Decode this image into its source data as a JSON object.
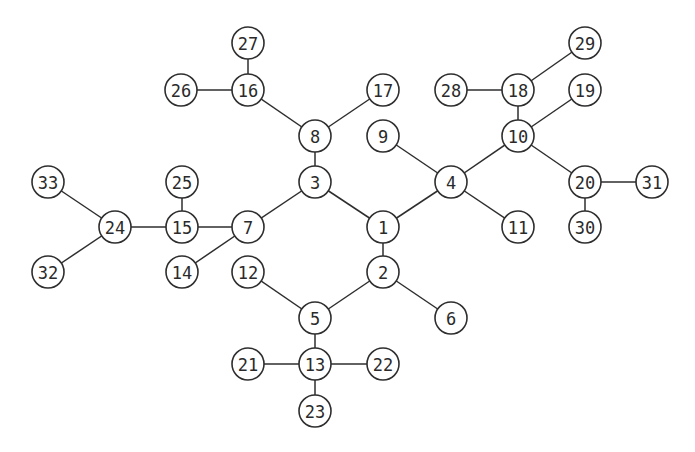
{
  "diagram": {
    "type": "tree",
    "node_radius": 16,
    "stroke_color": "#2e2e2e",
    "nodes": [
      {
        "id": "1",
        "label": "1",
        "x": 383,
        "y": 227
      },
      {
        "id": "2",
        "label": "2",
        "x": 383,
        "y": 272
      },
      {
        "id": "3",
        "label": "3",
        "x": 315,
        "y": 182
      },
      {
        "id": "4",
        "label": "4",
        "x": 451,
        "y": 182
      },
      {
        "id": "5",
        "label": "5",
        "x": 315,
        "y": 318
      },
      {
        "id": "6",
        "label": "6",
        "x": 451,
        "y": 318
      },
      {
        "id": "7",
        "label": "7",
        "x": 248,
        "y": 227
      },
      {
        "id": "8",
        "label": "8",
        "x": 315,
        "y": 136
      },
      {
        "id": "9",
        "label": "9",
        "x": 383,
        "y": 136
      },
      {
        "id": "10",
        "label": "10",
        "x": 518,
        "y": 136
      },
      {
        "id": "11",
        "label": "11",
        "x": 518,
        "y": 227
      },
      {
        "id": "12",
        "label": "12",
        "x": 248,
        "y": 272
      },
      {
        "id": "13",
        "label": "13",
        "x": 315,
        "y": 364
      },
      {
        "id": "14",
        "label": "14",
        "x": 182,
        "y": 272
      },
      {
        "id": "15",
        "label": "15",
        "x": 182,
        "y": 227
      },
      {
        "id": "16",
        "label": "16",
        "x": 248,
        "y": 90
      },
      {
        "id": "17",
        "label": "17",
        "x": 383,
        "y": 90
      },
      {
        "id": "18",
        "label": "18",
        "x": 518,
        "y": 90
      },
      {
        "id": "19",
        "label": "19",
        "x": 585,
        "y": 90
      },
      {
        "id": "20",
        "label": "20",
        "x": 585,
        "y": 182
      },
      {
        "id": "21",
        "label": "21",
        "x": 248,
        "y": 364
      },
      {
        "id": "22",
        "label": "22",
        "x": 383,
        "y": 364
      },
      {
        "id": "23",
        "label": "23",
        "x": 315,
        "y": 411
      },
      {
        "id": "24",
        "label": "24",
        "x": 115,
        "y": 227
      },
      {
        "id": "25",
        "label": "25",
        "x": 182,
        "y": 182
      },
      {
        "id": "26",
        "label": "26",
        "x": 181,
        "y": 90
      },
      {
        "id": "27",
        "label": "27",
        "x": 248,
        "y": 43
      },
      {
        "id": "28",
        "label": "28",
        "x": 451,
        "y": 90
      },
      {
        "id": "29",
        "label": "29",
        "x": 585,
        "y": 43
      },
      {
        "id": "30",
        "label": "30",
        "x": 585,
        "y": 227
      },
      {
        "id": "31",
        "label": "31",
        "x": 652,
        "y": 182
      },
      {
        "id": "32",
        "label": "32",
        "x": 48,
        "y": 272
      },
      {
        "id": "33",
        "label": "33",
        "x": 48,
        "y": 182
      }
    ],
    "edges": [
      [
        "27",
        "16"
      ],
      [
        "26",
        "16"
      ],
      [
        "16",
        "8"
      ],
      [
        "17",
        "8"
      ],
      [
        "8",
        "3"
      ],
      [
        "3",
        "7"
      ],
      [
        "3",
        "1"
      ],
      [
        "7",
        "15"
      ],
      [
        "7",
        "14"
      ],
      [
        "15",
        "25"
      ],
      [
        "15",
        "24"
      ],
      [
        "24",
        "33"
      ],
      [
        "24",
        "32"
      ],
      [
        "1",
        "4"
      ],
      [
        "1",
        "2"
      ],
      [
        "4",
        "9"
      ],
      [
        "4",
        "10"
      ],
      [
        "4",
        "11"
      ],
      [
        "10",
        "18"
      ],
      [
        "10",
        "19"
      ],
      [
        "10",
        "20"
      ],
      [
        "18",
        "28"
      ],
      [
        "18",
        "29"
      ],
      [
        "20",
        "31"
      ],
      [
        "20",
        "30"
      ],
      [
        "2",
        "5"
      ],
      [
        "2",
        "6"
      ],
      [
        "5",
        "12"
      ],
      [
        "5",
        "13"
      ],
      [
        "13",
        "21"
      ],
      [
        "13",
        "22"
      ],
      [
        "13",
        "23"
      ]
    ]
  }
}
